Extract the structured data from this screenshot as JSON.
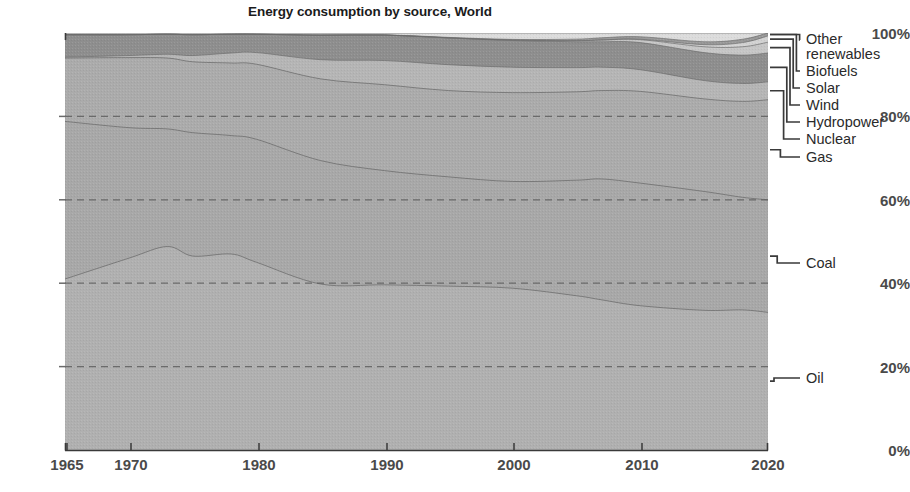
{
  "chart_data": {
    "type": "area",
    "title": "Energy consumption by source, World",
    "subtitle": "",
    "xlabel": "",
    "ylabel": "",
    "stacked": true,
    "normalized": true,
    "grid": true,
    "legend_position": "right-outside-leader-lines",
    "xlim": [
      1965,
      2020
    ],
    "ylim": [
      0,
      100
    ],
    "x_ticks": [
      "1965",
      "1970",
      "1980",
      "1990",
      "2000",
      "2010",
      "2020"
    ],
    "x_tick_values": [
      1965,
      1970,
      1980,
      1990,
      2000,
      2010,
      2020
    ],
    "y_ticks": [
      "0%",
      "20%",
      "40%",
      "60%",
      "80%",
      "100%"
    ],
    "y_tick_values": [
      0,
      20,
      40,
      60,
      80,
      100
    ],
    "x": [
      1965,
      1970,
      1973,
      1975,
      1978,
      1980,
      1985,
      1990,
      1995,
      2000,
      2005,
      2007,
      2010,
      2015,
      2018,
      2020
    ],
    "series": [
      {
        "name": "Oil",
        "color": "#b0b0b0",
        "values": [
          41.0,
          46.0,
          48.8,
          46.5,
          47.0,
          45.0,
          39.8,
          39.6,
          39.3,
          38.8,
          37.0,
          36.0,
          34.6,
          33.5,
          33.6,
          33.0
        ]
      },
      {
        "name": "Coal",
        "color": "#a8a8a8",
        "values": [
          37.8,
          31.3,
          28.2,
          29.6,
          28.4,
          29.5,
          29.6,
          27.4,
          26.2,
          25.6,
          27.7,
          29.0,
          29.4,
          28.5,
          27.0,
          27.0
        ]
      },
      {
        "name": "Gas",
        "color": "#ababab",
        "values": [
          15.2,
          16.8,
          17.0,
          17.0,
          17.4,
          18.0,
          19.6,
          20.6,
          20.7,
          21.3,
          21.2,
          21.2,
          22.0,
          22.2,
          23.0,
          24.0
        ]
      },
      {
        "name": "Nuclear",
        "color": "#b5b5b5",
        "values": [
          0.2,
          0.5,
          0.9,
          1.5,
          2.4,
          2.8,
          4.6,
          5.8,
          6.2,
          6.1,
          5.8,
          5.6,
          5.2,
          4.4,
          4.3,
          4.3
        ]
      },
      {
        "name": "Hydropower",
        "color": "#8e8e8e",
        "values": [
          5.4,
          5.0,
          4.8,
          5.0,
          4.5,
          4.4,
          5.9,
          6.1,
          6.4,
          6.4,
          6.2,
          6.1,
          6.5,
          6.7,
          6.8,
          6.9
        ]
      },
      {
        "name": "Wind",
        "color": "#c6c6c6",
        "values": [
          0.0,
          0.0,
          0.0,
          0.0,
          0.0,
          0.0,
          0.0,
          0.02,
          0.05,
          0.1,
          0.25,
          0.4,
          0.7,
          1.4,
          2.0,
          2.6
        ]
      },
      {
        "name": "Solar",
        "color": "#d2d2d2",
        "values": [
          0.0,
          0.0,
          0.0,
          0.0,
          0.0,
          0.0,
          0.0,
          0.0,
          0.0,
          0.01,
          0.03,
          0.05,
          0.1,
          0.5,
          1.0,
          1.5
        ]
      },
      {
        "name": "Biofuels",
        "color": "#9a9a9a",
        "values": [
          0.0,
          0.0,
          0.0,
          0.0,
          0.0,
          0.0,
          0.0,
          0.05,
          0.1,
          0.15,
          0.35,
          0.5,
          0.6,
          0.7,
          0.8,
          0.7
        ]
      },
      {
        "name": "Other renewables",
        "color": "#dcdcdc",
        "values": [
          0.4,
          0.4,
          0.3,
          0.4,
          0.3,
          0.3,
          0.5,
          0.43,
          1.05,
          1.54,
          1.47,
          1.15,
          0.9,
          2.1,
          1.5,
          0.0
        ]
      }
    ]
  },
  "legend": {
    "entries": [
      {
        "label": "Other",
        "second_line": "renewables",
        "series": "Other renewables"
      },
      {
        "label": "Biofuels",
        "series": "Biofuels"
      },
      {
        "label": "Solar",
        "series": "Solar"
      },
      {
        "label": "Wind",
        "series": "Wind"
      },
      {
        "label": "Hydropower",
        "series": "Hydropower"
      },
      {
        "label": "Nuclear",
        "series": "Nuclear"
      },
      {
        "label": "Gas",
        "series": "Gas"
      },
      {
        "label": "Coal",
        "series": "Coal"
      },
      {
        "label": "Oil",
        "series": "Oil"
      }
    ]
  },
  "style": {
    "plot_background": "#a9a9a9",
    "grid_color": "#6e6e6e",
    "axis_color": "#3a3a3a",
    "tick_text_color": "#4a4a4a",
    "title_color": "#1b1b1b",
    "legend_text_color": "#2a2a2a",
    "boundary_line_color": "#6a6a6a"
  }
}
